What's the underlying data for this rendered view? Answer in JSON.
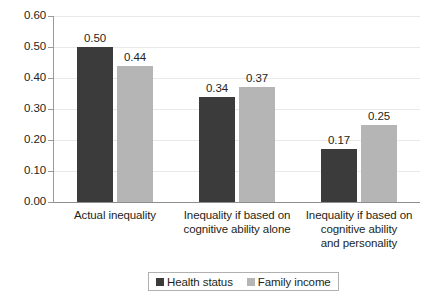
{
  "chart_data": {
    "type": "bar",
    "title": "",
    "subtitle": "",
    "xlabel": "",
    "ylabel": "",
    "ylim": [
      0.0,
      0.6
    ],
    "ytick_labels": [
      "0.60",
      "0.50",
      "0.40",
      "0.30",
      "0.20",
      "0.10",
      "0.00"
    ],
    "ytick_values": [
      0.6,
      0.5,
      0.4,
      0.3,
      0.2,
      0.1,
      0.0
    ],
    "grid": true,
    "legend_position": "bottom",
    "categories": [
      "Actual inequality",
      "Inequality if based on cognitive ability alone",
      "Inequality if based on cognitive ability and personality"
    ],
    "category_lines": [
      [
        "Actual inequality"
      ],
      [
        "Inequality if based on",
        "cognitive ability alone"
      ],
      [
        "Inequality if based on",
        "cognitive ability",
        "and personality"
      ]
    ],
    "series": [
      {
        "name": "Health status",
        "color": "#3b3b3b",
        "values": [
          0.5,
          0.34,
          0.17
        ],
        "value_labels": [
          "0.50",
          "0.34",
          "0.17"
        ]
      },
      {
        "name": "Family income",
        "color": "#b5b5b5",
        "values": [
          0.44,
          0.37,
          0.25
        ],
        "value_labels": [
          "0.44",
          "0.37",
          "0.25"
        ]
      }
    ]
  },
  "legend": {
    "entries": [
      {
        "label": "Health status",
        "swatch": "dark"
      },
      {
        "label": "Family income",
        "swatch": "light"
      }
    ]
  }
}
